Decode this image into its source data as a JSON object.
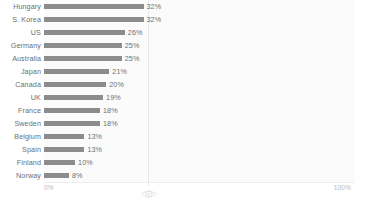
{
  "chart_data": {
    "type": "bar",
    "orientation": "horizontal",
    "title": "",
    "subtitle": "",
    "xlabel": "",
    "ylabel": "",
    "xlim": [
      0,
      100
    ],
    "grid": true,
    "legend": false,
    "legend_position": "none",
    "value_suffix": "%",
    "categories": [
      "Hungary",
      "S. Korea",
      "US",
      "Germany",
      "Australia",
      "Japan",
      "Canada",
      "UK",
      "France",
      "Sweden",
      "Belgium",
      "Spain",
      "Finland",
      "Norway"
    ],
    "values": [
      32,
      32,
      26,
      25,
      25,
      21,
      20,
      19,
      18,
      18,
      13,
      13,
      10,
      8
    ],
    "data_labels": [
      "32%",
      "32%",
      "26%",
      "25%",
      "25%",
      "21%",
      "20%",
      "19%",
      "18%",
      "18%",
      "13%",
      "13%",
      "10%",
      "8%"
    ],
    "xticks": [
      0,
      100
    ],
    "xtick_labels": [
      "0%",
      "100%"
    ],
    "bar_color": "#8c8c8c",
    "label_color": "#6e6e6e",
    "axis_label_color": "#b9b9b9",
    "plot_background": "#fbfbfb",
    "gridline_color": "#e8e8e8"
  },
  "axis": {
    "min_label": "0%",
    "max_label": "100%"
  },
  "marker": {
    "name": "flower-marker-icon"
  }
}
